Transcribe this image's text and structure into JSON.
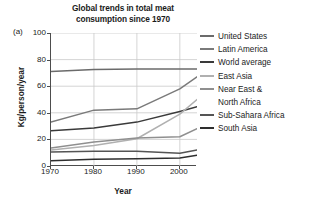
{
  "panel_letter": "(a)",
  "chart_data": {
    "type": "line",
    "title": "Global trends in total meat consumption since 1970",
    "title_lines": [
      "Global trends in total meat",
      "consumption since 1970"
    ],
    "xlabel": "Year",
    "ylabel": "Kg/person/year",
    "xlim": [
      1970,
      2004
    ],
    "ylim": [
      0,
      100
    ],
    "xticks": [
      1970,
      1980,
      1990,
      2000
    ],
    "yticks": [
      0,
      20,
      40,
      60,
      80,
      100
    ],
    "grid": true,
    "legend_position": "right",
    "x": [
      1970,
      1980,
      1990,
      2000,
      2004
    ],
    "series": [
      {
        "name": "United States",
        "color": "#6b6b6b",
        "values": [
          71,
          72.5,
          73,
          73,
          73
        ]
      },
      {
        "name": "Latin America",
        "color": "#7a7a7a",
        "values": [
          33,
          42,
          43,
          58,
          67
        ]
      },
      {
        "name": "World average",
        "color": "#3a3a3a",
        "values": [
          26.5,
          28.5,
          33,
          41,
          44.5
        ]
      },
      {
        "name": "East Asia",
        "color": "#b0b0b0",
        "values": [
          12,
          15.5,
          20.5,
          39,
          50
        ]
      },
      {
        "name": "Near East & North Africa",
        "color": "#8f8f8f",
        "values": [
          13.5,
          18,
          21,
          22,
          28
        ]
      },
      {
        "name": "Sub-Sahara Africa",
        "color": "#555555",
        "values": [
          10.5,
          11,
          11,
          9.5,
          12
        ]
      },
      {
        "name": "South Asia",
        "color": "#2e2e2e",
        "values": [
          4,
          5,
          5.5,
          6,
          8
        ]
      }
    ],
    "legend_entries": [
      {
        "label": "United States",
        "label_lines": [
          "United States"
        ],
        "color": "#6b6b6b"
      },
      {
        "label": "Latin America",
        "label_lines": [
          "Latin America"
        ],
        "color": "#7a7a7a"
      },
      {
        "label": "World average",
        "label_lines": [
          "World average"
        ],
        "color": "#3a3a3a"
      },
      {
        "label": "East Asia",
        "label_lines": [
          "East Asia"
        ],
        "color": "#b0b0b0"
      },
      {
        "label": "Near East & North Africa",
        "label_lines": [
          "Near East &",
          "North Africa"
        ],
        "color": "#8f8f8f"
      },
      {
        "label": "Sub-Sahara Africa",
        "label_lines": [
          "Sub-Sahara Africa"
        ],
        "color": "#555555"
      },
      {
        "label": "South Asia",
        "label_lines": [
          "South Asia"
        ],
        "color": "#2e2e2e"
      }
    ]
  }
}
